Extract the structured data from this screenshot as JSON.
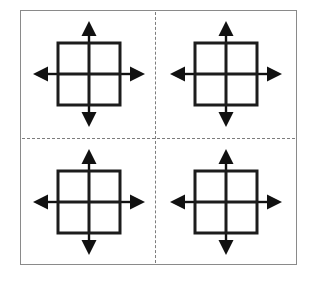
{
  "figure": {
    "background_color": "#ffffff",
    "frame": {
      "name": "outer-border",
      "stroke_color": "#8a8a8a",
      "stroke_width": 1.5,
      "x": 20,
      "y": 10,
      "width": 277,
      "height": 255
    },
    "dividers": {
      "style": "dashed",
      "stroke_color": "#7d7d7d",
      "stroke_width": 1.5,
      "dash_length": 8,
      "gap_length": 5,
      "vertical_x": 155,
      "horizontal_y": 138
    },
    "quadrant_count": 4,
    "quadrants": [
      {
        "id": "top-left",
        "label": "Top left quadrant",
        "position": "top-left",
        "motif": "grid-square-with-four-outward-arrows"
      },
      {
        "id": "top-right",
        "label": "Top right quadrant",
        "position": "top-right",
        "motif": "grid-square-with-four-outward-arrows"
      },
      {
        "id": "bottom-left",
        "label": "Bottom left quadrant",
        "position": "bottom-left",
        "motif": "grid-square-with-four-outward-arrows"
      },
      {
        "id": "bottom-right",
        "label": "Bottom right quadrant",
        "position": "bottom-right",
        "motif": "grid-square-with-four-outward-arrows"
      }
    ],
    "motif": {
      "name": "grid-square-with-four-outward-arrows",
      "square": {
        "stroke_color": "#1c1c1c",
        "stroke_width": 3,
        "fill": "#ffffff",
        "size": 62,
        "subdivisions": "2x2",
        "inner_cross_stroke_width": 3
      },
      "arrows": {
        "count": 4,
        "directions": [
          "up",
          "right",
          "down",
          "left"
        ],
        "fill_color": "#111111",
        "shaft_width": 2.4,
        "head_width": 15,
        "head_length": 14,
        "length": 29,
        "pointing": "outward"
      }
    }
  }
}
